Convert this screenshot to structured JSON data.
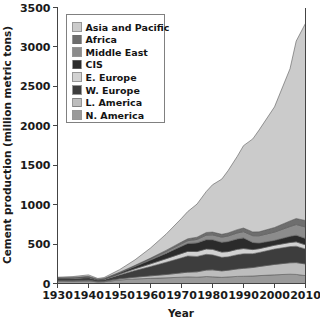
{
  "chart_data": {
    "type": "area",
    "stacked": true,
    "title": "",
    "xlabel": "Year",
    "ylabel": "Cement production (million metric tons)",
    "xlim": [
      1930,
      2010
    ],
    "ylim": [
      0,
      3500
    ],
    "xticks": [
      1930,
      1940,
      1950,
      1960,
      1970,
      1980,
      1990,
      2000,
      2010
    ],
    "yticks": [
      0,
      500,
      1000,
      1500,
      2000,
      2500,
      3000,
      3500
    ],
    "grid": false,
    "legend_position": "upper-left-inside",
    "x": [
      1930,
      1935,
      1940,
      1943,
      1945,
      1950,
      1955,
      1960,
      1965,
      1970,
      1972,
      1975,
      1978,
      1980,
      1983,
      1985,
      1988,
      1990,
      1993,
      1995,
      2000,
      2005,
      2007,
      2010
    ],
    "series": [
      {
        "name": "N. America",
        "color": "#9a9a9a",
        "values": [
          30,
          28,
          32,
          20,
          22,
          45,
          58,
          65,
          72,
          80,
          84,
          80,
          88,
          85,
          78,
          83,
          90,
          92,
          95,
          100,
          110,
          118,
          115,
          100
        ]
      },
      {
        "name": "L. America",
        "color": "#bdbdbd",
        "values": [
          5,
          6,
          8,
          6,
          7,
          14,
          22,
          32,
          42,
          55,
          60,
          68,
          82,
          88,
          82,
          85,
          95,
          100,
          108,
          115,
          132,
          145,
          150,
          148
        ]
      },
      {
        "name": "W. Europe",
        "color": "#3d3d3d",
        "values": [
          28,
          30,
          34,
          18,
          20,
          50,
          85,
          118,
          155,
          190,
          205,
          195,
          200,
          190,
          172,
          170,
          180,
          185,
          175,
          178,
          195,
          205,
          208,
          190
        ]
      },
      {
        "name": "E. Europe",
        "color": "#d2d2d2",
        "values": [
          4,
          5,
          6,
          4,
          5,
          12,
          22,
          34,
          45,
          55,
          58,
          62,
          68,
          70,
          66,
          66,
          68,
          66,
          52,
          48,
          48,
          52,
          55,
          52
        ]
      },
      {
        "name": "CIS",
        "color": "#2b2b2b",
        "values": [
          3,
          5,
          7,
          4,
          5,
          14,
          28,
          48,
          68,
          92,
          100,
          110,
          118,
          122,
          124,
          128,
          132,
          135,
          90,
          72,
          62,
          78,
          85,
          82
        ]
      },
      {
        "name": "Middle East",
        "color": "#8c8c8c",
        "values": [
          1,
          1,
          2,
          1,
          2,
          4,
          8,
          14,
          22,
          32,
          36,
          44,
          58,
          62,
          66,
          70,
          76,
          80,
          86,
          92,
          105,
          125,
          135,
          145
        ]
      },
      {
        "name": "Africa",
        "color": "#6e6e6e",
        "values": [
          1,
          1,
          2,
          1,
          2,
          4,
          7,
          11,
          16,
          22,
          24,
          28,
          33,
          35,
          36,
          38,
          42,
          45,
          48,
          50,
          58,
          70,
          76,
          82
        ]
      },
      {
        "name": "Asia and Pacific",
        "color": "#cbcbcb",
        "values": [
          8,
          12,
          18,
          10,
          12,
          32,
          70,
          128,
          205,
          300,
          345,
          420,
          520,
          600,
          700,
          790,
          930,
          1045,
          1180,
          1290,
          1530,
          1930,
          2250,
          2500
        ]
      }
    ],
    "totals": [
      80,
      88,
      109,
      64,
      75,
      175,
      300,
      450,
      625,
      826,
      912,
      1007,
      1167,
      1252,
      1324,
      1430,
      1613,
      1748,
      1834,
      1945,
      2240,
      2723,
      3074,
      3299
    ]
  },
  "legend": {
    "entries": [
      {
        "label": "Asia and Pacific",
        "color": "#cbcbcb"
      },
      {
        "label": "Africa",
        "color": "#6e6e6e"
      },
      {
        "label": "Middle East",
        "color": "#8c8c8c"
      },
      {
        "label": "CIS",
        "color": "#2b2b2b"
      },
      {
        "label": "E. Europe",
        "color": "#d2d2d2"
      },
      {
        "label": "W. Europe",
        "color": "#3d3d3d"
      },
      {
        "label": "L. America",
        "color": "#bdbdbd"
      },
      {
        "label": "N. America",
        "color": "#9a9a9a"
      }
    ]
  },
  "axes": {
    "x_title": "Year",
    "y_title": "Cement production (million metric tons)",
    "x_tick_labels": [
      "1930",
      "1940",
      "1950",
      "1960",
      "1970",
      "1980",
      "1990",
      "2000",
      "2010"
    ],
    "y_tick_labels": [
      "0",
      "500",
      "1000",
      "1500",
      "2000",
      "2500",
      "3000",
      "3500"
    ]
  }
}
